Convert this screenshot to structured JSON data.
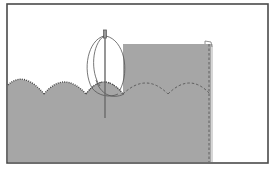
{
  "diagram": {
    "colors": {
      "background": "#ffffff",
      "frame": "#4a4a4a",
      "fabric": "#a6a6a6",
      "stitch": "#555555",
      "needle": "#6a6a6a",
      "thread": "#555555"
    },
    "elements": {
      "frame": "illustration-frame",
      "fabric_lower": "scalloped-fabric-panel",
      "fabric_upper": "folded-fabric-flap",
      "scallops_stitched": 3,
      "scallops_dashed": 3,
      "needle": "sewing-needle",
      "thread": "thread-loop"
    }
  }
}
